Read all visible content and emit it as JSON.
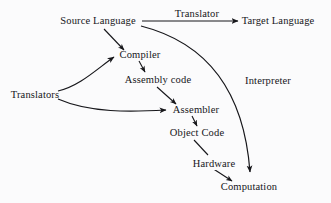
{
  "diagram": {
    "background_color": "#fbfbfc",
    "ink_color": "#16161a",
    "nodes": [
      {
        "id": "source_language",
        "label": "Source Language",
        "x": 98,
        "y": 21
      },
      {
        "id": "target_language",
        "label": "Target Language",
        "x": 278,
        "y": 21
      },
      {
        "id": "compiler",
        "label": "Compiler",
        "x": 140,
        "y": 55
      },
      {
        "id": "assembly_code",
        "label": "Assembly code",
        "x": 158,
        "y": 80
      },
      {
        "id": "translators",
        "label": "Translators",
        "x": 35,
        "y": 95
      },
      {
        "id": "assembler",
        "label": "Assembler",
        "x": 196,
        "y": 110
      },
      {
        "id": "object_code",
        "label": "Object Code",
        "x": 197,
        "y": 133
      },
      {
        "id": "computation",
        "label": "Computation",
        "x": 249,
        "y": 187
      }
    ],
    "edge_labels": [
      {
        "id": "translator",
        "label": "Translator",
        "x": 197,
        "y": 14
      },
      {
        "id": "interpreter",
        "label": "Interpreter",
        "x": 268,
        "y": 81
      },
      {
        "id": "hardware",
        "label": "Hardware",
        "x": 214,
        "y": 164
      }
    ],
    "edges": [
      {
        "id": "source-to-target",
        "from": "source_language",
        "to": "target_language",
        "label": "Translator",
        "shape": "straight"
      },
      {
        "id": "source-to-compiler",
        "from": "source_language",
        "to": "compiler",
        "shape": "straight"
      },
      {
        "id": "source-to-computation",
        "from": "source_language",
        "to": "computation",
        "label": "Interpreter",
        "shape": "curved"
      },
      {
        "id": "compiler-to-assembly-code",
        "from": "compiler",
        "to": "assembly_code",
        "shape": "straight"
      },
      {
        "id": "assembly-code-to-assembler",
        "from": "assembly_code",
        "to": "assembler",
        "shape": "straight"
      },
      {
        "id": "translators-to-compiler",
        "from": "translators",
        "to": "compiler",
        "shape": "curved"
      },
      {
        "id": "translators-to-assembler",
        "from": "translators",
        "to": "assembler",
        "shape": "curved"
      },
      {
        "id": "assembler-to-object-code",
        "from": "assembler",
        "to": "object_code",
        "shape": "straight"
      },
      {
        "id": "object-code-to-computation",
        "from": "object_code",
        "to": "computation",
        "label": "Hardware",
        "shape": "straight"
      }
    ]
  }
}
